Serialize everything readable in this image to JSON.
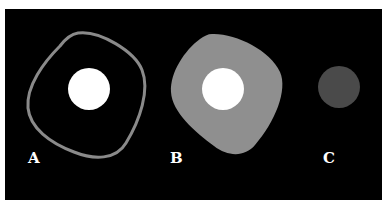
{
  "figure": {
    "background": "#000000",
    "panels": [
      {
        "id": "A",
        "label": "A",
        "description": "outlined rounded-square cell with white nucleus",
        "outline_color": "#8a8a8a",
        "nucleus_color": "#ffffff"
      },
      {
        "id": "B",
        "label": "B",
        "description": "filled gray rounded-square cell with white nucleus",
        "fill_color": "#8f8f8f",
        "nucleus_color": "#ffffff"
      },
      {
        "id": "C",
        "label": "C",
        "description": "small dark gray circle",
        "fill_color": "#4a4a4a"
      }
    ]
  }
}
